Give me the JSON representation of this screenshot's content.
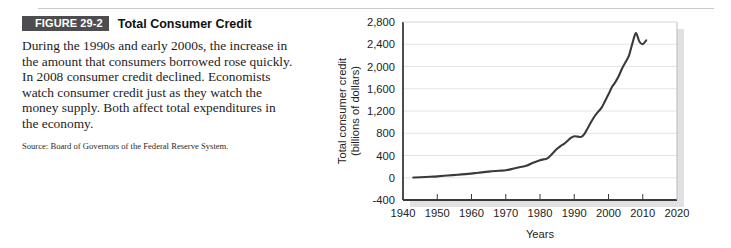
{
  "figure": {
    "badge": "FIGURE 29-2",
    "title": "Total Consumer Credit",
    "body": "During the 1990s and early 2000s, the increase in the amount that consumers borrowed rose quickly. In 2008 consumer credit declined. Economists watch consumer credit just as they watch the money supply. Both affect total expenditures in the economy.",
    "source": "Source: Board of Governors of the Federal Reserve System."
  },
  "colors": {
    "badge_bg": "#4d4d4f",
    "badge_text": "#ffffff",
    "line": "#3a3a3a",
    "axis": "#3a3a3a",
    "grid": "#e4e4e7",
    "rule": "#c9c9cc",
    "text": "#1c1c1c"
  },
  "chart_data": {
    "type": "line",
    "title": "Total Consumer Credit",
    "xlabel": "Years",
    "ylabel": "Total consumer credit (billions of dollars)",
    "ylabel_line1": "Total consumer credit",
    "ylabel_line2": "(billions of dollars)",
    "xlim": [
      1940,
      2020
    ],
    "ylim": [
      -400,
      2800
    ],
    "xticks": [
      1940,
      1950,
      1960,
      1970,
      1980,
      1990,
      2000,
      2010,
      2020
    ],
    "xtick_labels": [
      "1940",
      "1950",
      "1960",
      "1970",
      "1980",
      "1990",
      "2000",
      "2010",
      "2020"
    ],
    "yticks": [
      -400,
      0,
      400,
      800,
      1200,
      1600,
      2000,
      2400,
      2800
    ],
    "ytick_labels": [
      "-400",
      "0",
      "400",
      "800",
      "1,200",
      "1,600",
      "2,000",
      "2,400",
      "2,800"
    ],
    "grid": "horizontal",
    "legend": "none",
    "series": [
      {
        "name": "Total consumer credit",
        "x": [
          1943,
          1945,
          1948,
          1950,
          1953,
          1956,
          1959,
          1962,
          1965,
          1968,
          1970,
          1972,
          1974,
          1976,
          1978,
          1980,
          1981,
          1982,
          1983,
          1984,
          1985,
          1986,
          1987,
          1988,
          1989,
          1990,
          1991,
          1992,
          1993,
          1994,
          1995,
          1996,
          1997,
          1998,
          1999,
          2000,
          2001,
          2002,
          2003,
          2004,
          2005,
          2006,
          2007,
          2008,
          2009,
          2010,
          2011
        ],
        "y": [
          5,
          8,
          18,
          25,
          40,
          55,
          70,
          90,
          110,
          125,
          135,
          160,
          190,
          215,
          270,
          315,
          330,
          345,
          395,
          460,
          520,
          570,
          610,
          660,
          715,
          745,
          740,
          735,
          790,
          900,
          1010,
          1110,
          1190,
          1260,
          1380,
          1500,
          1630,
          1720,
          1830,
          1970,
          2080,
          2200,
          2420,
          2600,
          2450,
          2400,
          2470
        ]
      }
    ]
  }
}
